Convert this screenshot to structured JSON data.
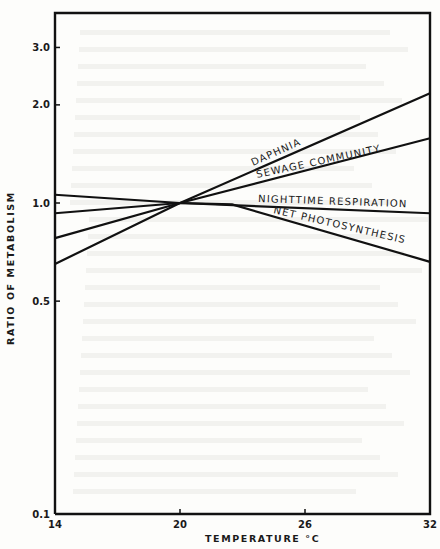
{
  "chart_data": {
    "type": "line",
    "title": "",
    "xlabel": "TEMPERATURE °C",
    "ylabel": "RATIO OF METABOLISM",
    "x_ticks": [
      14,
      20,
      26,
      32
    ],
    "x_tick_labels": [
      "14",
      "20",
      "26",
      "32"
    ],
    "y_scale": "log",
    "y_ticks": [
      0.1,
      0.5,
      1.0,
      2.0,
      3.0
    ],
    "y_tick_labels": [
      "0.1",
      "0.5",
      "1.0",
      "2.0",
      "3.0"
    ],
    "xlim": [
      14,
      32
    ],
    "ylim": [
      0.1,
      4.0
    ],
    "grid": false,
    "legend": "inline labels on lines",
    "x": [
      14,
      20,
      32
    ],
    "series": [
      {
        "name": "DAPHNIA",
        "x": [
          14,
          20,
          32
        ],
        "values": [
          0.65,
          1.0,
          2.17
        ]
      },
      {
        "name": "SEWAGE COMMUNITY",
        "x": [
          14,
          20,
          32
        ],
        "values": [
          0.78,
          1.0,
          1.58
        ]
      },
      {
        "name": "NIGHTTIME RESPIRATION",
        "x": [
          14,
          20,
          32
        ],
        "values": [
          0.93,
          1.0,
          0.93
        ]
      },
      {
        "name": "NET PHOTOSYNTHESIS",
        "x": [
          14,
          20,
          22.5,
          32
        ],
        "values": [
          1.06,
          1.0,
          0.99,
          0.66
        ]
      }
    ]
  }
}
